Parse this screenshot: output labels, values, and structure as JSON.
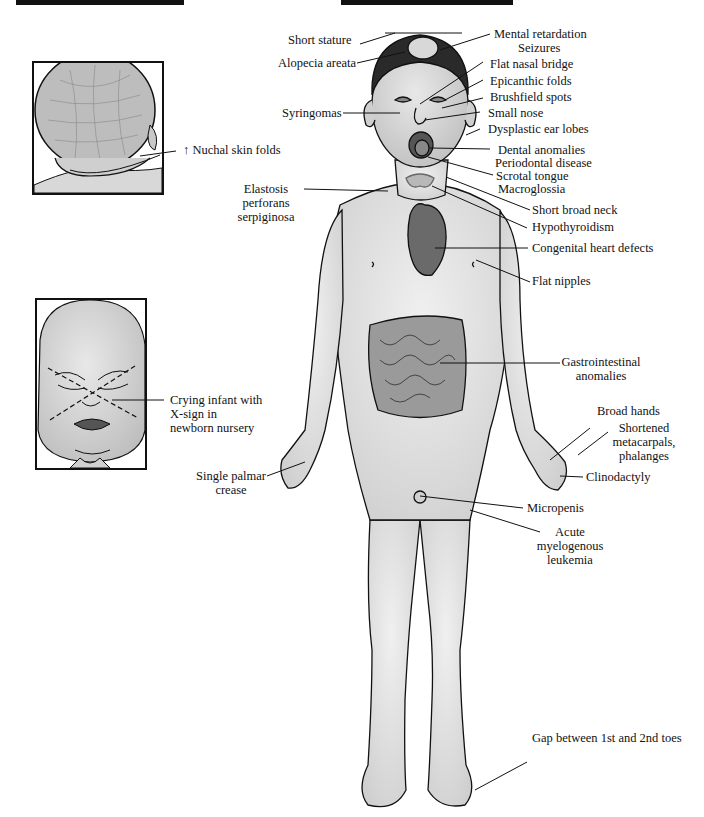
{
  "figure": {
    "topic": "Down syndrome clinical features",
    "top_bars": [
      {
        "x": 16,
        "width": 168
      },
      {
        "x": 341,
        "width": 172
      }
    ]
  },
  "insets": {
    "nuchal": {
      "label": "↑ Nuchal skin folds"
    },
    "crying_infant": {
      "label_lines": [
        "Crying infant with",
        "X-sign in",
        "newborn nursery"
      ]
    }
  },
  "labels": {
    "short_stature": "Short stature",
    "alopecia_areata": "Alopecia areata",
    "mental_retardation": "Mental retardation",
    "seizures": "Seizures",
    "flat_nasal_bridge": "Flat nasal bridge",
    "epicanthic_folds": "Epicanthic folds",
    "brushfield_spots": "Brushfield spots",
    "syringomas": "Syringomas",
    "small_nose": "Small nose",
    "dysplastic_ear_lobes": "Dysplastic ear lobes",
    "dental_anomalies": "Dental anomalies",
    "periodontal_disease": "Periodontal disease",
    "scrotal_tongue": "Scrotal tongue",
    "macroglossia": "Macroglossia",
    "elastosis": [
      "Elastosis",
      "perforans",
      "serpiginosa"
    ],
    "short_broad_neck": "Short broad neck",
    "hypothyroidism": "Hypothyroidism",
    "congenital_heart_defects": "Congenital heart defects",
    "flat_nipples": "Flat nipples",
    "gastrointestinal": [
      "Gastrointestinal",
      "anomalies"
    ],
    "broad_hands": "Broad hands",
    "shortened_metacarpals": [
      "Shortened",
      "metacarpals,",
      "phalanges"
    ],
    "single_palmar_crease": [
      "Single palmar",
      "crease"
    ],
    "clinodactyly": "Clinodactyly",
    "micropenis": "Micropenis",
    "aml": [
      "Acute",
      "myelogenous",
      "leukemia"
    ],
    "toe_gap": "Gap between 1st and 2nd toes"
  },
  "colors": {
    "ink": "#111111",
    "skin": "#e4e4e4",
    "skin_shade": "#cfcfcf",
    "hair": "#2a2a2a",
    "heart": "#6a6a6a",
    "intestine": "#9a9a9a"
  }
}
